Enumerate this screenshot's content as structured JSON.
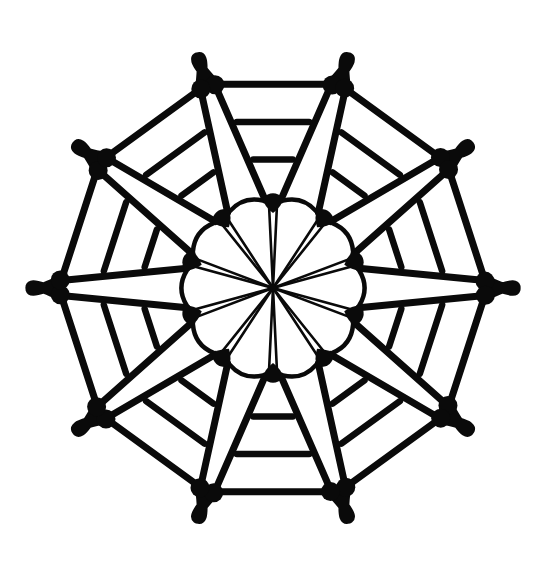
{
  "canvas": {
    "width": 544,
    "height": 571,
    "background_color": "#ffffff",
    "ink_color": "#0a0a0a"
  },
  "artwork": {
    "title": "Radial Rosette Line Drawing",
    "description": "Black-and-white ten-fold symmetric rosette of tapered wedge petals around a central hub",
    "style": "ink line drawing",
    "symmetry_order": 10,
    "center": {
      "x": 273,
      "y": 288
    },
    "outer_radius": 240
  },
  "chart_data": {
    "type": "scatter",
    "xlabel": "",
    "ylabel": "",
    "grid": false,
    "legend_position": "none",
    "symmetry_order": 10,
    "center": [
      273,
      288
    ],
    "angles_deg": [
      270,
      306,
      342,
      18,
      54,
      90,
      126,
      162,
      198,
      234
    ],
    "petal_inner_radius": 88,
    "petal_outer_radius": 212,
    "petal_inner_halfwidth_deg": 5,
    "petal_outer_halfwidth_deg": 16,
    "rungs_per_petal": 2,
    "rung_radii": [
      130,
      170
    ],
    "node_radius_outer": 212,
    "node_radius_inner": 88,
    "spokes_per_petal": 2,
    "outer_arc_stroke": 11,
    "petal_stroke": 7,
    "spoke_stroke": 2.6,
    "series": [
      {
        "name": "outer-arcs",
        "count": 10
      },
      {
        "name": "petals",
        "count": 10
      },
      {
        "name": "rungs",
        "count": 20
      },
      {
        "name": "spokes",
        "count": 20
      },
      {
        "name": "rim-chords",
        "count": 10
      },
      {
        "name": "nodes",
        "count": 20
      }
    ]
  },
  "elements": {
    "petals_label": "petal",
    "arcs_label": "outer-arc",
    "hub_label": "center-hub"
  }
}
